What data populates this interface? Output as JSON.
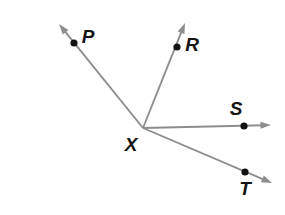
{
  "figure": {
    "background_color": "#ffffff",
    "ray_color": "#8d8d8d",
    "point_color": "#121212",
    "label_color": "#141414",
    "width": 285,
    "height": 215
  },
  "vertex": {
    "label": "X",
    "name": "vertex-x",
    "x": 143,
    "y": 128,
    "label_x": 131,
    "label_y": 146,
    "has_dot": false
  },
  "points": [
    {
      "label": "P",
      "name": "point-p",
      "x": 74,
      "y": 43,
      "label_x": 88,
      "label_y": 38
    },
    {
      "label": "R",
      "name": "point-r",
      "x": 177,
      "y": 47,
      "label_x": 192,
      "label_y": 46
    },
    {
      "label": "S",
      "name": "point-s",
      "x": 244,
      "y": 126,
      "label_x": 236,
      "label_y": 110
    },
    {
      "label": "T",
      "name": "point-t",
      "x": 245,
      "y": 172,
      "label_x": 245,
      "label_y": 190
    }
  ],
  "rays": [
    {
      "name": "ray-xp",
      "label": "XP",
      "from": "X",
      "through": "P",
      "x1": 143,
      "y1": 128,
      "x2": 59,
      "y2": 24,
      "arrow_angle_deg": 231
    },
    {
      "name": "ray-xr",
      "label": "XR",
      "from": "X",
      "through": "R",
      "x1": 143,
      "y1": 128,
      "x2": 185,
      "y2": 23,
      "arrow_angle_deg": 292
    },
    {
      "name": "ray-xs",
      "label": "XS",
      "from": "X",
      "through": "S",
      "x1": 143,
      "y1": 128,
      "x2": 271,
      "y2": 125,
      "arrow_angle_deg": 359
    },
    {
      "name": "ray-xt",
      "label": "XT",
      "from": "X",
      "through": "T",
      "x1": 143,
      "y1": 128,
      "x2": 272,
      "y2": 183,
      "arrow_angle_deg": 23
    }
  ]
}
